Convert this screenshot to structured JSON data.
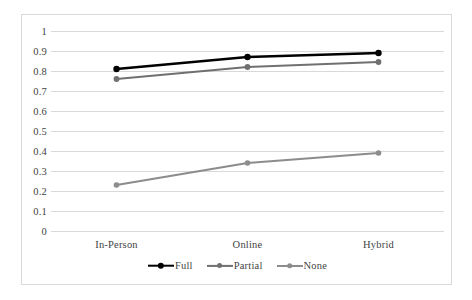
{
  "chart_data": {
    "type": "line",
    "title": "",
    "subtitle": "",
    "xlabel": "",
    "ylabel": "",
    "categories": [
      "In-Person",
      "Online",
      "Hybrid"
    ],
    "series": [
      {
        "name": "Full",
        "values": [
          0.81,
          0.87,
          0.89
        ],
        "color": "#000000",
        "line_width": 2.6,
        "marker": "circle",
        "marker_size": 5.2
      },
      {
        "name": "Partial",
        "values": [
          0.76,
          0.82,
          0.845
        ],
        "color": "#707070",
        "line_width": 2.2,
        "marker": "circle",
        "marker_size": 4.6
      },
      {
        "name": "None",
        "values": [
          0.23,
          0.34,
          0.39
        ],
        "color": "#8c8c8c",
        "line_width": 2.0,
        "marker": "circle",
        "marker_size": 4.4
      }
    ],
    "ylim": [
      0,
      1
    ],
    "ytick_labels": [
      "0",
      "0.1",
      "0.2",
      "0.3",
      "0.4",
      "0.5",
      "0.6",
      "0.7",
      "0.8",
      "0.9",
      "1"
    ],
    "ytick_values": [
      0,
      0.1,
      0.2,
      0.3,
      0.4,
      0.5,
      0.6,
      0.7,
      0.8,
      0.9,
      1
    ],
    "grid": {
      "horizontal": true,
      "vertical": false,
      "color": "#d9d9d9"
    },
    "legend": {
      "position": "bottom",
      "entries": [
        "Full",
        "Partial",
        "None"
      ]
    },
    "plot_border_color": "#d9d9d9",
    "background": "#ffffff",
    "text_color": "#3f3f3f"
  }
}
